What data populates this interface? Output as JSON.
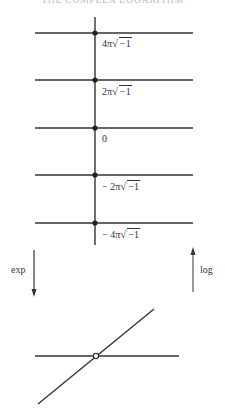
{
  "header": {
    "text": "THE COMPLEX LOGARITHM"
  },
  "upper_diagram": {
    "vertical_axis": {
      "x": 95,
      "y_top": 17,
      "y_bottom": 245
    },
    "lines": [
      {
        "y": 33,
        "label_prefix": "4π",
        "label_radicand": "−1",
        "label": "4π√−1"
      },
      {
        "y": 80,
        "label_prefix": "2π",
        "label_radicand": "−1",
        "label": "2π√−1"
      },
      {
        "y": 128,
        "label_prefix": "0",
        "label_radicand": "",
        "label": "0"
      },
      {
        "y": 175,
        "label_prefix": "− 2π",
        "label_radicand": "−1",
        "label": "− 2π√−1"
      },
      {
        "y": 223,
        "label_prefix": "− 4π",
        "label_radicand": "−1",
        "label": "− 4π√−1"
      }
    ],
    "line_x_start": 35,
    "line_x_end": 193
  },
  "arrows": {
    "exp": {
      "label": "exp",
      "direction": "down",
      "x": 34,
      "y_start": 250,
      "y_end": 296
    },
    "log": {
      "label": "log",
      "direction": "up",
      "x": 193,
      "y_start": 292,
      "y_end": 248
    }
  },
  "lower_diagram": {
    "horizontal_line": {
      "x1": 35,
      "y1": 356,
      "x2": 179,
      "y2": 356
    },
    "diagonal_line": {
      "x1": 38,
      "y1": 404,
      "x2": 154,
      "y2": 309
    },
    "origin_marker": {
      "x": 96,
      "y": 356,
      "style": "open-circle"
    }
  },
  "colors": {
    "stroke": "#333333",
    "background": "#ffffff"
  }
}
